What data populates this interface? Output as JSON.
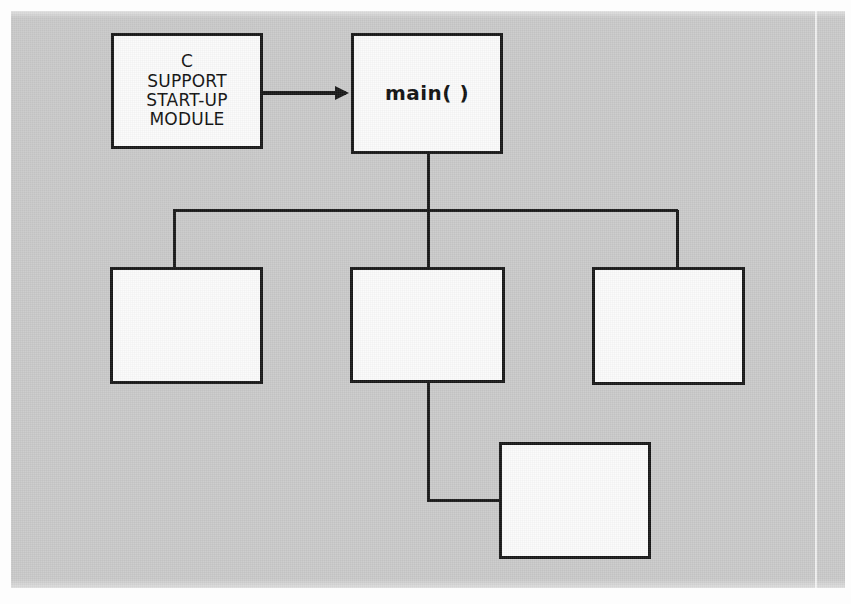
{
  "figure": {
    "kind": "block-diagram",
    "title_text": "",
    "background_color": "#c9c9c9",
    "box_fill_color": "#fbfbfb",
    "line_color": "#171717"
  },
  "nodes": [
    {
      "id": "startup-module",
      "label": "C\nSUPPORT\nSTART-UP\nMODULE",
      "style": "caps",
      "empty": false
    },
    {
      "id": "main",
      "label": "main( )",
      "style": "bold",
      "empty": false
    },
    {
      "id": "child-left",
      "label": "",
      "style": "caps",
      "empty": true
    },
    {
      "id": "child-middle",
      "label": "",
      "style": "caps",
      "empty": true
    },
    {
      "id": "child-right",
      "label": "",
      "style": "caps",
      "empty": true
    },
    {
      "id": "grandchild",
      "label": "",
      "style": "caps",
      "empty": true
    }
  ],
  "connectors": [
    {
      "id": "startup-to-main",
      "from": "startup-module",
      "to": "main",
      "arrowhead": true,
      "routing": "horizontal"
    },
    {
      "id": "main-to-children-bus",
      "from": "main",
      "to": "child-left, child-middle, child-right",
      "arrowhead": false,
      "routing": "orthogonal-bus"
    },
    {
      "id": "middle-to-grandchild",
      "from": "child-middle",
      "to": "grandchild",
      "arrowhead": false,
      "routing": "down-then-right"
    }
  ]
}
